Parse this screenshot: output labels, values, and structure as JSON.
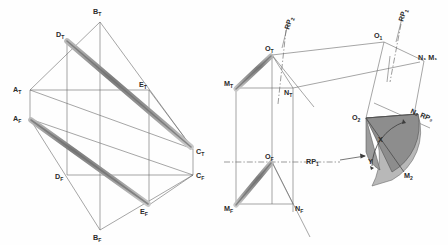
{
  "drawing": {
    "title": "Descriptive geometry: orthographic projections with auxiliary revolution",
    "background_color": "#fefefe",
    "line_color": "#555555",
    "band_color": "#8a8a8a",
    "sector_fill_dark": "#8f8f8f",
    "sector_fill_light": "#b5b5b5",
    "label_color": "#2b2b2b"
  },
  "figure_left": {
    "name": "two-view-projection-tetrahedron",
    "points": {
      "A_T": {
        "label": "A",
        "sub": "T",
        "x": 30,
        "y": 90,
        "lx": 14,
        "ly": 90
      },
      "B_T": {
        "label": "B",
        "sub": "T",
        "x": 100,
        "y": 22,
        "lx": 93,
        "ly": 13
      },
      "C_T": {
        "label": "C",
        "sub": "T",
        "x": 193,
        "y": 149,
        "lx": 196,
        "ly": 154
      },
      "D_T": {
        "label": "D",
        "sub": "T",
        "x": 67,
        "y": 41,
        "lx": 57,
        "ly": 36
      },
      "E_T": {
        "label": "E",
        "sub": "T",
        "x": 149,
        "y": 90,
        "lx": 140,
        "ly": 86
      },
      "A_F": {
        "label": "A",
        "sub": "F",
        "x": 30,
        "y": 119,
        "lx": 14,
        "ly": 119
      },
      "B_F": {
        "label": "B",
        "sub": "F",
        "x": 100,
        "y": 230,
        "lx": 93,
        "ly": 239
      },
      "C_F": {
        "label": "C",
        "sub": "F",
        "x": 193,
        "y": 175,
        "lx": 196,
        "ly": 178
      },
      "D_F": {
        "label": "D",
        "sub": "F",
        "x": 67,
        "y": 175,
        "lx": 56,
        "ly": 179
      },
      "E_F": {
        "label": "E",
        "sub": "F",
        "x": 149,
        "y": 205,
        "lx": 141,
        "ly": 213
      }
    },
    "thin_edges": [
      [
        "A_T",
        "B_T"
      ],
      [
        "B_T",
        "C_T"
      ],
      [
        "A_T",
        "C_T"
      ],
      [
        "A_T",
        "E_T"
      ],
      [
        "D_T",
        "B_T"
      ],
      [
        "A_F",
        "B_F"
      ],
      [
        "B_F",
        "C_F"
      ],
      [
        "A_F",
        "C_F"
      ],
      [
        "A_F",
        "D_F"
      ],
      [
        "D_F",
        "C_F"
      ],
      [
        "A_T",
        "A_F"
      ],
      [
        "B_T",
        "B_F"
      ],
      [
        "C_T",
        "C_F"
      ],
      [
        "D_T",
        "D_F"
      ],
      [
        "E_T",
        "E_F"
      ],
      [
        "A_F",
        "E_F"
      ],
      [
        "E_F",
        "C_F"
      ],
      [
        "A_T",
        "D_T"
      ],
      [
        "E_T",
        "C_T"
      ],
      [
        "D_F",
        "B_F"
      ]
    ],
    "bands": [
      {
        "name": "band-top-view",
        "from": "D_T",
        "to": "C_T",
        "width": 5.5
      },
      {
        "name": "band-front-view",
        "from": "A_F",
        "to": "E_F",
        "width": 5.5
      }
    ]
  },
  "figure_right": {
    "name": "auxiliary-view-angle-revolution",
    "points": {
      "O_T": {
        "label": "O",
        "sub": "T",
        "x": 272,
        "y": 55,
        "lx": 266,
        "ly": 50
      },
      "M_T": {
        "label": "M",
        "sub": "T",
        "x": 236,
        "y": 88,
        "lx": 226,
        "ly": 84
      },
      "N_T": {
        "label": "N",
        "sub": "T",
        "x": 293,
        "y": 88,
        "lx": 285,
        "ly": 93
      },
      "O_F": {
        "label": "O",
        "sub": "F",
        "x": 272,
        "y": 162,
        "lx": 266,
        "ly": 158
      },
      "M_F": {
        "label": "M",
        "sub": "F",
        "x": 236,
        "y": 204,
        "lx": 226,
        "ly": 209
      },
      "N_F": {
        "label": "N",
        "sub": "F",
        "x": 293,
        "y": 204,
        "lx": 296,
        "ly": 209
      },
      "O_1": {
        "label": "O",
        "sub": "1",
        "x": 384,
        "y": 42,
        "lx": 374,
        "ly": 38
      },
      "N_1M_1": {
        "label": "N₁ M₁",
        "x": 424,
        "y": 61,
        "lx": 420,
        "ly": 59
      },
      "O_2": {
        "label": "O",
        "sub": "2",
        "x": 366,
        "y": 118,
        "lx": 353,
        "ly": 118
      },
      "M_2": {
        "label": "M",
        "sub": "2",
        "x": 404,
        "y": 170,
        "lx": 405,
        "ly": 175
      },
      "N_2": {
        "label": "N₂ RP₂",
        "x": 414,
        "y": 115,
        "lx": 410,
        "ly": 114
      }
    },
    "reference_planes": [
      {
        "name": "rp1-label",
        "text": "RP",
        "sub": "1",
        "x": 313,
        "y": 162,
        "rotate": 0
      },
      {
        "name": "rp2-top-label",
        "text": "RP",
        "sub": "2",
        "x": 291,
        "y": 29,
        "rotate": -72
      },
      {
        "name": "rp1-aux-label",
        "text": "RP",
        "sub": "1",
        "x": 404,
        "y": 22,
        "rotate": -72
      },
      {
        "name": "rp2-aux-label",
        "text": "N₂ RP₂",
        "x": 411,
        "y": 113,
        "rotate": 22
      }
    ],
    "sector_labels": [
      {
        "name": "angle-x-label",
        "text": "X",
        "x": 381,
        "y": 140
      },
      {
        "name": "angle-y-label",
        "text": "Y",
        "x": 371,
        "y": 161
      }
    ]
  },
  "labels_all": [
    "A_T",
    "B_T",
    "C_T",
    "D_T",
    "E_T",
    "A_F",
    "B_F",
    "C_F",
    "D_F",
    "E_F",
    "O_T",
    "M_T",
    "N_T",
    "O_F",
    "M_F",
    "N_F",
    "O_1",
    "N_1 M_1",
    "O_2",
    "M_2",
    "N_2",
    "RP_1",
    "RP_2",
    "X",
    "Y"
  ]
}
